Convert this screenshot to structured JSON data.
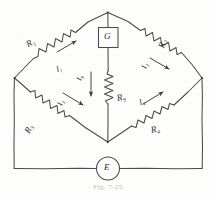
{
  "figure": {
    "caption": "Fig. 7-25",
    "style": "hand-drawn pen sketch",
    "ink_color": "#3a3a3a",
    "background_color": "#fdfdfc"
  },
  "components": {
    "resistors": [
      {
        "id": "R1",
        "name": "R",
        "subscript": "1",
        "label": "R₁",
        "position": "upper-left-arm"
      },
      {
        "id": "R2",
        "name": "R",
        "subscript": "2",
        "label": "R₂",
        "position": "upper-right-arm"
      },
      {
        "id": "R3",
        "name": "R",
        "subscript": "3",
        "label": "R₃",
        "position": "lower-left-arm"
      },
      {
        "id": "R4",
        "name": "R",
        "subscript": "4",
        "label": "R₄",
        "position": "lower-right-arm"
      },
      {
        "id": "Rg",
        "name": "R",
        "subscript": "g",
        "label": "R₉",
        "position": "bridge-center-vertical"
      }
    ],
    "galvanometer": {
      "id": "G",
      "label": "G",
      "shape": "square",
      "position": "top-center-branch"
    },
    "source": {
      "id": "E",
      "label": "E",
      "shape": "circle",
      "position": "bottom-rail-center"
    }
  },
  "currents": [
    {
      "id": "I1",
      "name": "I",
      "subscript": "1",
      "label": "I₁",
      "direction": "toward-top-node",
      "arm": "upper-left"
    },
    {
      "id": "I2",
      "name": "I",
      "subscript": "2",
      "label": "I₂",
      "direction": "away-from-top-node",
      "arm": "upper-right"
    },
    {
      "id": "I3",
      "name": "I",
      "subscript": "3",
      "label": "I₃",
      "direction": "toward-bottom-node",
      "arm": "lower-left"
    },
    {
      "id": "I4",
      "name": "I",
      "subscript": "4",
      "label": "I₄",
      "direction": "away-from-bottom-node",
      "arm": "lower-right"
    },
    {
      "id": "Ig",
      "name": "I",
      "subscript": "g",
      "label": "I₉",
      "direction": "downward",
      "arm": "bridge-center"
    }
  ],
  "nodes": {
    "top": "apex node joining R1, R2 and galvanometer branch",
    "left": "left node joining R1, R3 and source rail",
    "right": "right node joining R2, R4 and source rail",
    "bottom": "bottom node joining R3, R4 and Rg"
  }
}
